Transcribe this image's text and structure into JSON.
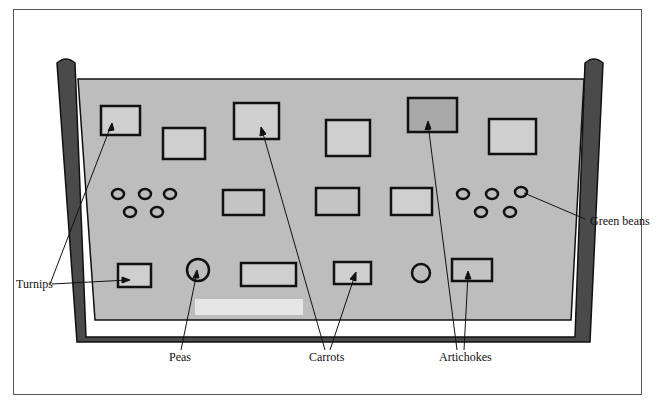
{
  "figure": {
    "labels": {
      "turnips": "Turnips",
      "peas": "Peas",
      "carrots": "Carrots",
      "artichokes": "Artichokes",
      "green_beans": "Green beans"
    },
    "colors": {
      "tray_wall": "#4a4a4a",
      "tray_fill": "#bdbdbd",
      "item_light": "#cfcfcf",
      "item_dark": "#a9a9a9",
      "outline": "#111111",
      "highlight": "#e6e6e6"
    }
  }
}
